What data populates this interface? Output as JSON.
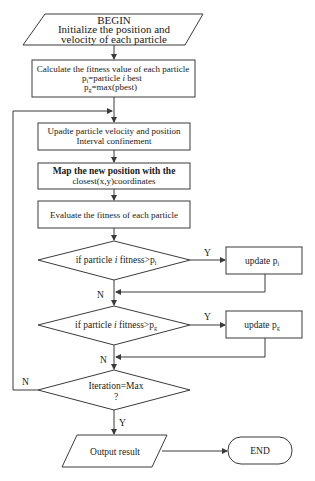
{
  "colors": {
    "stroke": "#3a3a3a",
    "text": "#1a1a1a",
    "background": "#ffffff"
  },
  "nodes": {
    "begin": {
      "line1": "BEGIN",
      "line2": "Initialize the position and",
      "line3": "velocity of each particle"
    },
    "calc_fitness": {
      "line1": "Calculate the fitness value of each particle",
      "line2_pre": "p",
      "line2_sub": "i",
      "line2_post": "=particle ",
      "line2_ital": "i",
      "line2_end": " best",
      "line3_pre": "p",
      "line3_sub": "g",
      "line3_post": "=max(pbest)"
    },
    "update_velocity": {
      "line1": "Upadte particle velocity and position",
      "line2": "Interval confinement"
    },
    "map_position": {
      "line1": "Map the new position with the",
      "line2": "closest(x,y)coordinates"
    },
    "evaluate": {
      "line1": "Evaluate the fitness of each particle"
    },
    "decision_pi": {
      "pre": "if particle ",
      "ital": "i",
      "post": " fitness>p",
      "sub": "i"
    },
    "update_pi": {
      "pre": "update p",
      "sub": "i"
    },
    "decision_pg": {
      "pre": "if particle ",
      "ital": "i",
      "post": " fitness>p",
      "sub": "g"
    },
    "update_pg": {
      "pre": "update p",
      "sub": "g"
    },
    "decision_iter": {
      "line1": "Iteration=Max",
      "line2": "?"
    },
    "output": {
      "label": "Output result"
    },
    "end": {
      "label": "END"
    }
  },
  "edge_labels": {
    "pi_yes": "Y",
    "pi_no": "N",
    "pg_yes": "Y",
    "pg_no": "N",
    "iter_no": "N",
    "iter_yes": "Y"
  }
}
